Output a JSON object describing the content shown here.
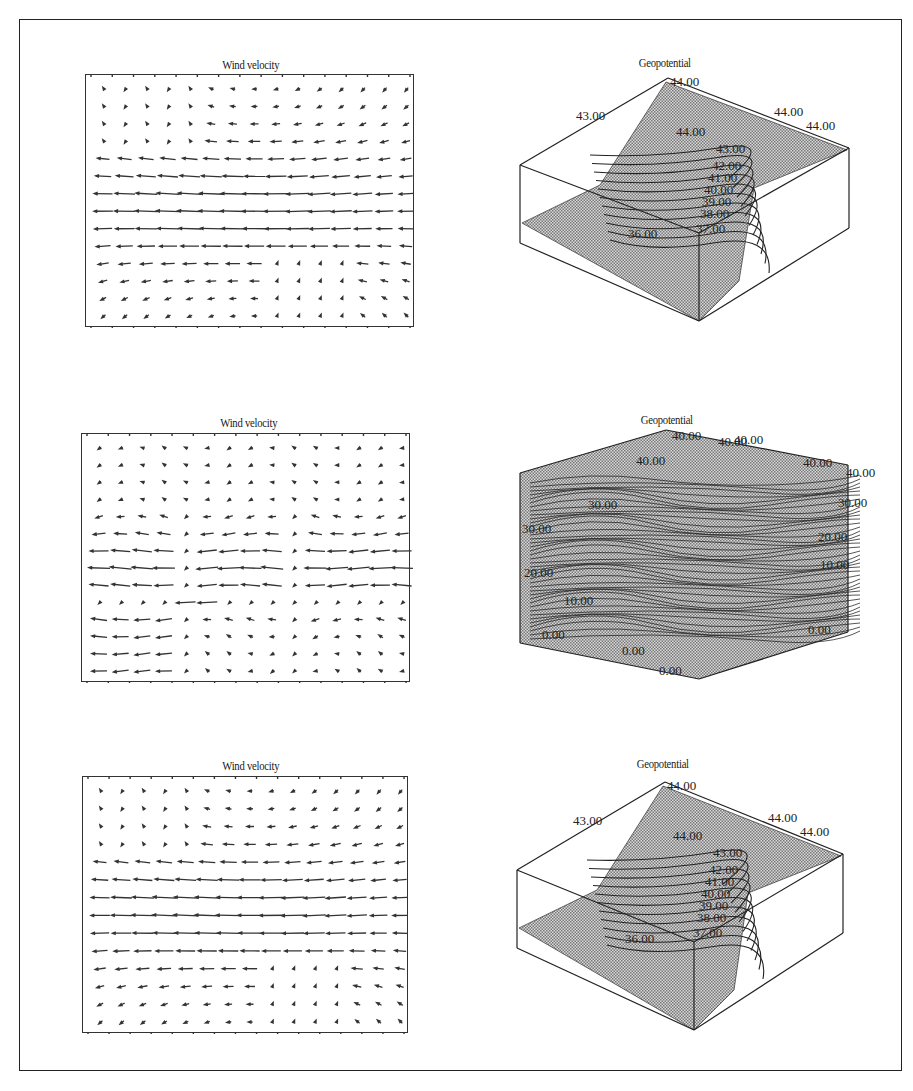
{
  "figure": {
    "panels": [
      {
        "row": 1,
        "wind": {
          "title": "Wind velocity"
        },
        "geo": {
          "title": "Geopotential",
          "style": "surface",
          "labels": [
            "44.00",
            "43.00",
            "44.00",
            "44.00",
            "44.00",
            "43.00",
            "42.00",
            "41.00",
            "40.00",
            "39.00",
            "38.00",
            "37.00",
            "36.00"
          ]
        }
      },
      {
        "row": 2,
        "wind": {
          "title": "Wind velocity"
        },
        "geo": {
          "title": "Geopotential",
          "style": "isosurface-block",
          "labels": [
            "40.00",
            "40.00",
            "40.00",
            "40.00",
            "40.00",
            "40.00",
            "30.00",
            "30.00",
            "30.00",
            "20.00",
            "20.00",
            "10.00",
            "10.00",
            "0.00",
            "0.00",
            "0.00",
            "0.00"
          ]
        }
      },
      {
        "row": 3,
        "wind": {
          "title": "Wind velocity"
        },
        "geo": {
          "title": "Geopotential",
          "style": "surface",
          "labels": [
            "44.00",
            "43.00",
            "44.00",
            "44.00",
            "44.00",
            "43.00",
            "42.00",
            "41.00",
            "40.00",
            "39.00",
            "38.00",
            "37.00",
            "36.00"
          ]
        }
      }
    ]
  },
  "chart_data": [
    {
      "type": "quiver",
      "title": "Wind velocity",
      "grid": {
        "cols": 15,
        "rows": 14
      },
      "description": "Strong westward (leftward) jet across middle rows, weak rotational flow near corners",
      "panel": 1
    },
    {
      "type": "surface3d",
      "title": "Geopotential",
      "contour_levels": [
        36.0,
        37.0,
        38.0,
        39.0,
        40.0,
        41.0,
        42.0,
        43.0,
        44.0
      ],
      "visible_labels": [
        "44.00",
        "43.00",
        "44.00",
        "44.00",
        "44.00",
        "43.00",
        "36.00"
      ],
      "panel": 1
    },
    {
      "type": "quiver",
      "title": "Wind velocity",
      "grid": {
        "cols": 15,
        "rows": 14
      },
      "description": "Westward jets broken into segments with a discontinuity near center column",
      "panel": 2
    },
    {
      "type": "surface3d",
      "title": "Geopotential",
      "contour_levels": [
        0.0,
        10.0,
        20.0,
        30.0,
        40.0
      ],
      "visible_labels": [
        "40.00",
        "30.00",
        "20.00",
        "10.00",
        "0.00"
      ],
      "panel": 2
    },
    {
      "type": "quiver",
      "title": "Wind velocity",
      "grid": {
        "cols": 15,
        "rows": 14
      },
      "description": "Strong westward jet across middle rows, similar to panel 1",
      "panel": 3
    },
    {
      "type": "surface3d",
      "title": "Geopotential",
      "contour_levels": [
        36.0,
        37.0,
        38.0,
        39.0,
        40.0,
        41.0,
        42.0,
        43.0,
        44.0
      ],
      "visible_labels": [
        "44.00",
        "43.00",
        "44.00",
        "44.00",
        "44.00",
        "43.00",
        "36.00"
      ],
      "panel": 3
    }
  ]
}
